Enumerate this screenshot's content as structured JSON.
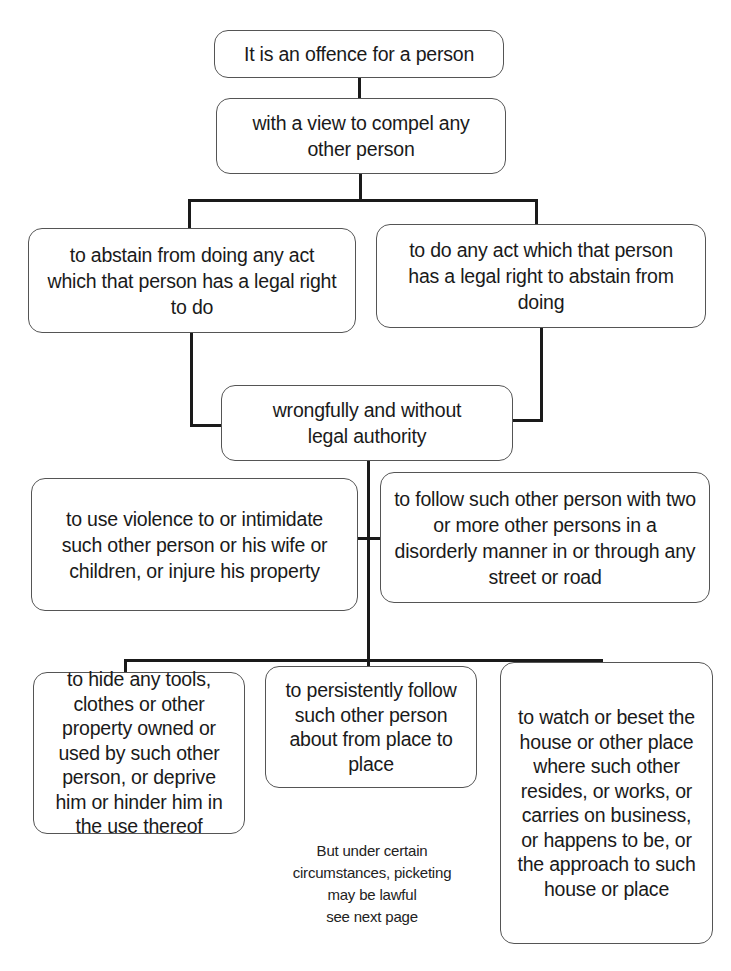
{
  "diagram": {
    "type": "flowchart",
    "nodes": [
      {
        "id": "n1",
        "text": "It is an offence for a person"
      },
      {
        "id": "n2",
        "text": "with a view to compel any other person"
      },
      {
        "id": "n3",
        "text": "to abstain from doing any act which that person has a legal right to do"
      },
      {
        "id": "n4",
        "text": "to do any act which that person has a legal right to abstain from doing"
      },
      {
        "id": "n5",
        "text": "wrongfully and without legal authority"
      },
      {
        "id": "n6",
        "text": "to use violence to or intimidate such other person or his wife or children, or injure his property"
      },
      {
        "id": "n7",
        "text": "to follow such other person with two or more other persons in a disorderly manner in or through any street or road"
      },
      {
        "id": "n8",
        "text": "to hide any tools, clothes or other property owned or used by such other person, or deprive him or hinder him in the use thereof"
      },
      {
        "id": "n9",
        "text": "to persistently follow such other person about from place to place"
      },
      {
        "id": "n10",
        "text": "to watch or beset the house or other place where such other resides, or works, or carries on business, or happens to be, or the approach to such house or place"
      }
    ],
    "edges": [
      [
        "n1",
        "n2"
      ],
      [
        "n2",
        "n3"
      ],
      [
        "n2",
        "n4"
      ],
      [
        "n3",
        "n5"
      ],
      [
        "n4",
        "n5"
      ],
      [
        "n5",
        "n6"
      ],
      [
        "n5",
        "n7"
      ],
      [
        "n5",
        "n8"
      ],
      [
        "n5",
        "n9"
      ],
      [
        "n5",
        "n10"
      ]
    ],
    "note": {
      "line1": "But under certain",
      "line2": "circumstances, picketing",
      "line3": "may be lawful",
      "line4": "see next page"
    }
  }
}
